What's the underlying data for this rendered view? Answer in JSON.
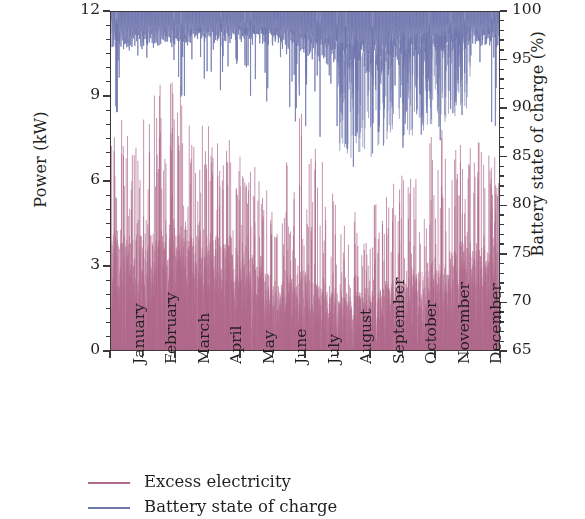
{
  "chart_data": {
    "type": "line",
    "title": "",
    "subtitle": "",
    "xlabel": "",
    "ylabel": "Power (kW)",
    "y2label": "Battery state of charge (%)",
    "ylim": [
      0,
      12
    ],
    "y2lim": [
      65,
      100
    ],
    "xlim": [
      "January",
      "December"
    ],
    "grid": false,
    "legend_position": "below-left",
    "y_ticks": [
      "0",
      "3",
      "6",
      "9",
      "12"
    ],
    "y_tick_values": [
      0,
      3,
      6,
      9,
      12
    ],
    "y_minor_step": 0.5,
    "y2_ticks": [
      "65",
      "70",
      "75",
      "80",
      "85",
      "90",
      "95",
      "100"
    ],
    "y2_tick_values": [
      65,
      70,
      75,
      80,
      85,
      90,
      95,
      100
    ],
    "y2_minor_step": 1,
    "x_tick_labels": [
      "January",
      "February",
      "March",
      "April",
      "May",
      "June",
      "July",
      "August",
      "September",
      "October",
      "November",
      "December"
    ],
    "x_tick_rotation": -90,
    "colors": {
      "excess_electricity": "#b06a8c",
      "battery_soc": "#6f77ad",
      "axis": "#3c3a3e",
      "background": "#ffffff"
    },
    "series": [
      {
        "name": "Excess electricity",
        "axis": "left",
        "units": "kW",
        "color": "#b06a8c",
        "render": "dense-vertical-spikes",
        "description": "Hourly excess electricity spikes over one year; baseline near 0 kW with a dense band from 0 to about 4 kW and frequent spikes reaching 6-9 kW.",
        "monthly_profile": [
          {
            "month": "January",
            "typical_max": 7.9,
            "band_top": 4.4,
            "density": 0.92,
            "peak": 8.1
          },
          {
            "month": "February",
            "typical_max": 7.4,
            "band_top": 4.1,
            "density": 0.9,
            "peak": 9.2
          },
          {
            "month": "March",
            "typical_max": 9.3,
            "band_top": 4.6,
            "density": 0.93,
            "peak": 9.4
          },
          {
            "month": "April",
            "typical_max": 7.6,
            "band_top": 4.3,
            "density": 0.91,
            "peak": 8.0
          },
          {
            "month": "May",
            "typical_max": 7.1,
            "band_top": 4.0,
            "density": 0.88,
            "peak": 7.3
          },
          {
            "month": "June",
            "typical_max": 4.9,
            "band_top": 2.6,
            "density": 0.72,
            "peak": 5.2
          },
          {
            "month": "July",
            "typical_max": 5.6,
            "band_top": 2.9,
            "density": 0.74,
            "peak": 8.9
          },
          {
            "month": "August",
            "typical_max": 4.4,
            "band_top": 2.2,
            "density": 0.66,
            "peak": 4.8
          },
          {
            "month": "September",
            "typical_max": 4.6,
            "band_top": 2.3,
            "density": 0.64,
            "peak": 5.0
          },
          {
            "month": "October",
            "typical_max": 5.2,
            "band_top": 2.8,
            "density": 0.76,
            "peak": 6.3
          },
          {
            "month": "November",
            "typical_max": 6.0,
            "band_top": 3.4,
            "density": 0.84,
            "peak": 7.7
          },
          {
            "month": "December",
            "typical_max": 7.3,
            "band_top": 3.9,
            "density": 0.89,
            "peak": 7.6
          }
        ]
      },
      {
        "name": "Battery state of charge",
        "axis": "right",
        "units": "%",
        "color": "#6f77ad",
        "render": "dense-noisy-band-with-drops",
        "description": "Battery state of charge fluctuates in a dense band just under 100% for most of the year, with deeper discharge excursions in late summer and autumn.",
        "monthly_profile": [
          {
            "month": "January",
            "band_top": 100,
            "band_bottom": 96.5,
            "min": 89.0
          },
          {
            "month": "February",
            "band_top": 100,
            "band_bottom": 96.8,
            "min": 92.5
          },
          {
            "month": "March",
            "band_top": 100,
            "band_bottom": 97.0,
            "min": 93.0
          },
          {
            "month": "April",
            "band_top": 100,
            "band_bottom": 97.2,
            "min": 93.5
          },
          {
            "month": "May",
            "band_top": 100,
            "band_bottom": 97.3,
            "min": 94.0
          },
          {
            "month": "June",
            "band_top": 100,
            "band_bottom": 97.0,
            "min": 91.0
          },
          {
            "month": "July",
            "band_top": 100,
            "band_bottom": 96.0,
            "min": 88.5
          },
          {
            "month": "August",
            "band_top": 100,
            "band_bottom": 95.0,
            "min": 84.5
          },
          {
            "month": "September",
            "band_top": 100,
            "band_bottom": 94.5,
            "min": 85.0
          },
          {
            "month": "October",
            "band_top": 100,
            "band_bottom": 95.5,
            "min": 86.5
          },
          {
            "month": "November",
            "band_top": 100,
            "band_bottom": 96.2,
            "min": 88.0
          },
          {
            "month": "December",
            "band_top": 100,
            "band_bottom": 96.8,
            "min": 90.0
          }
        ]
      }
    ]
  },
  "axes": {
    "left": {
      "title": "Power (kW)",
      "ticks": [
        "0",
        "3",
        "6",
        "9",
        "12"
      ]
    },
    "right": {
      "title": "Battery state of charge (%)",
      "ticks": [
        "65",
        "70",
        "75",
        "80",
        "85",
        "90",
        "95",
        "100"
      ]
    },
    "bottom": {
      "ticks": [
        "January",
        "February",
        "March",
        "April",
        "May",
        "June",
        "July",
        "August",
        "September",
        "October",
        "November",
        "December"
      ]
    }
  },
  "legend": {
    "items": [
      {
        "label": "Excess electricity",
        "color": "#b06a8c"
      },
      {
        "label": "Battery state of charge",
        "color": "#6f77ad"
      }
    ]
  }
}
